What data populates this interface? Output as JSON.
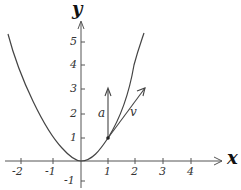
{
  "diagram": {
    "axes": {
      "x_label": "x",
      "y_label": "y",
      "x_ticks": [
        "-2",
        "-1",
        "1",
        "2",
        "3",
        "4"
      ],
      "y_ticks": [
        "5",
        "4",
        "3",
        "2",
        "1",
        "-1"
      ]
    },
    "curve": {
      "equation": "y = x^2",
      "color": "#444444"
    },
    "point": {
      "x": 1,
      "y": 1
    },
    "vectors": [
      {
        "name": "a",
        "from": [
          1,
          1
        ],
        "to": [
          1,
          3
        ]
      },
      {
        "name": "v",
        "from": [
          1,
          1
        ],
        "to": [
          2.3,
          3
        ]
      }
    ]
  }
}
